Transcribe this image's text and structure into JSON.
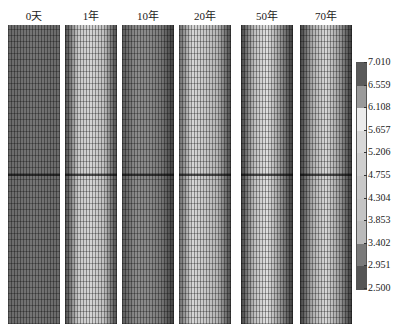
{
  "chart_data": {
    "type": "heatmap",
    "title": "",
    "panels": [
      {
        "label": "0天",
        "profile": "uniform-dark",
        "stops": [
          "#6a6a6a",
          "#707070",
          "#757575",
          "#707070",
          "#6a6a6a"
        ]
      },
      {
        "label": "1年",
        "profile": "light-with-dark-edges",
        "stops": [
          "#4a4a4a",
          "#c8c8c8",
          "#d4d4d4",
          "#c0c0c0",
          "#4a4a4a"
        ]
      },
      {
        "label": "10年",
        "profile": "medium-dark-right-edge",
        "stops": [
          "#5a5a5a",
          "#8a8a8a",
          "#8a8a8a",
          "#7a7a7a",
          "#3e3e3e"
        ]
      },
      {
        "label": "20年",
        "profile": "light-center-dark-edges",
        "stops": [
          "#6a6a6a",
          "#d6d6d6",
          "#c8c8c8",
          "#b4b4b4",
          "#4a4a4a"
        ]
      },
      {
        "label": "50年",
        "profile": "light-center-dark-edges",
        "stops": [
          "#404040",
          "#bdbdbd",
          "#e0e0e0",
          "#9a9a9a",
          "#3a3a3a"
        ]
      },
      {
        "label": "70年",
        "profile": "light-center-dark-edges",
        "stops": [
          "#404040",
          "#b0b0b0",
          "#d8d8d8",
          "#a0a0a0",
          "#3a3a3a"
        ]
      }
    ],
    "colorbar": {
      "ticks": [
        "7.010",
        "6.559",
        "6.108",
        "5.657",
        "5.206",
        "4.755",
        "4.304",
        "3.853",
        "3.402",
        "2.951",
        "2.500"
      ],
      "range": [
        2.5,
        7.01
      ],
      "segments": [
        "#5a5a5a",
        "#9a9a9a",
        "#ececec",
        "#d8d8d8",
        "#cfcfcf",
        "#c8c8c8",
        "#c4c4c4",
        "#bababa",
        "#7a7a7a",
        "#555555"
      ]
    },
    "xlabel": "",
    "ylabel": "",
    "legend_position": "right"
  }
}
